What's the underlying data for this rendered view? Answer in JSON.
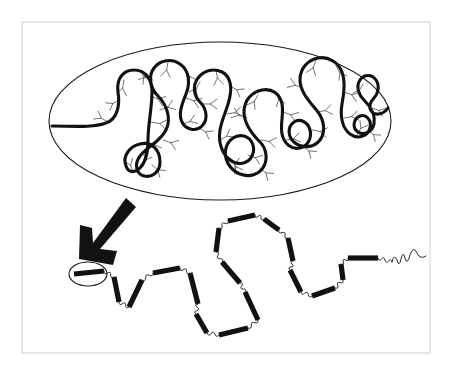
{
  "figure": {
    "title": "Condensed coiled biopolymer and its extended rod-and-coil conformation",
    "background_color": "#ffffff",
    "frame_color": "#d8d8d8",
    "ink_color": "#111111",
    "branch_color": "#5b5b5b"
  },
  "frame": {
    "name": "figure-border",
    "x": 22,
    "y": 22,
    "width": 408,
    "height": 331
  },
  "panels": [
    {
      "id": "condensed-panel",
      "label": "condensed coiled state inside oval compartment",
      "shape": "ellipse",
      "center_x": 220,
      "center_y": 121,
      "radius_x": 171,
      "radius_y": 79
    },
    {
      "id": "extended-panel",
      "label": "extended rod-and-coil chain",
      "shape": "open chain",
      "x": 60,
      "y": 205,
      "width": 350,
      "height": 145
    }
  ],
  "arrow": {
    "name": "transition-arrow",
    "label": "unfolding transition arrow",
    "direction": "down-left",
    "from_x": 124,
    "from_y": 200,
    "to_x": 88,
    "to_y": 258,
    "color": "#121212"
  },
  "highlight": {
    "name": "segment-highlight",
    "label": "circled single rigid rod segment",
    "center_x": 88,
    "center_y": 274,
    "radius_x": 19,
    "radius_y": 12
  },
  "condensed_backbone": {
    "name": "folded-backbone",
    "stroke_width": 3.1,
    "description": "thick serpentine backbone folded into four vertical loops spanning the oval",
    "path": "M 52 126 C 72 126 92 128 106 123 C 118 119 120 104 118 92 C 116 78 124 70 134 70 C 146 70 152 80 152 92 C 152 108 148 124 148 140 C 148 152 146 162 140 168 C 134 174 128 172 126 166 C 122 156 130 146 140 144 C 152 141 160 150 160 162 C 160 172 152 178 144 176 C 136 174 134 164 140 156 C 148 146 160 142 166 130 C 172 118 166 104 158 96 C 150 88 148 76 154 68 C 160 60 172 58 180 64 C 190 71 190 84 186 94 C 182 104 178 114 182 122 C 186 130 196 132 202 126 C 209 119 206 108 200 102 C 194 96 192 86 198 78 C 204 70 214 68 222 72 C 230 76 232 86 230 96 C 228 108 222 118 220 130 C 218 142 222 154 230 160 C 238 166 248 164 252 156 C 256 148 252 138 244 136 C 236 134 228 140 226 148 C 223 159 230 170 240 174 C 250 178 260 174 264 166 C 268 158 266 148 260 142 C 252 134 244 124 244 112 C 244 100 252 92 262 90 C 272 88 280 94 282 104 C 284 114 280 124 282 134 C 284 144 292 150 300 148 C 308 146 312 138 310 130 C 308 122 300 118 294 122 C 287 127 288 137 294 142 C 302 149 314 148 320 140 C 326 132 324 120 318 112 C 310 102 300 92 300 80 C 300 68 308 60 318 58 C 328 56 338 62 342 72 C 346 82 344 94 342 104 C 340 116 342 128 350 134 C 358 140 368 136 370 128 C 372 120 366 114 360 116 C 353 119 352 128 358 132 C 364 136 372 132 374 124 C 376 114 370 106 364 100 C 358 94 356 86 360 80 C 364 74 372 74 376 80 C 380 86 378 94 374 98 C 370 102 368 108 372 112 C 376 116 384 114 388 108"
  },
  "side_branches": {
    "name": "side-chain-branches",
    "count": 46,
    "style": "short thin Y-shaped tufts radiating from the backbone",
    "stroke_width": 0.85,
    "items": [
      {
        "x": 108,
        "y": 122,
        "angle": 210,
        "len": 14
      },
      {
        "x": 119,
        "y": 100,
        "angle": 150,
        "len": 13
      },
      {
        "x": 124,
        "y": 80,
        "angle": 100,
        "len": 15
      },
      {
        "x": 140,
        "y": 70,
        "angle": 60,
        "len": 14
      },
      {
        "x": 150,
        "y": 96,
        "angle": 20,
        "len": 15
      },
      {
        "x": 151,
        "y": 122,
        "angle": 10,
        "len": 16
      },
      {
        "x": 147,
        "y": 146,
        "angle": 350,
        "len": 14
      },
      {
        "x": 141,
        "y": 167,
        "angle": 300,
        "len": 14
      },
      {
        "x": 133,
        "y": 172,
        "angle": 250,
        "len": 13
      },
      {
        "x": 152,
        "y": 165,
        "angle": 40,
        "len": 14
      },
      {
        "x": 163,
        "y": 140,
        "angle": 20,
        "len": 15
      },
      {
        "x": 160,
        "y": 110,
        "angle": 340,
        "len": 15
      },
      {
        "x": 153,
        "y": 80,
        "angle": 200,
        "len": 14
      },
      {
        "x": 168,
        "y": 62,
        "angle": 100,
        "len": 15
      },
      {
        "x": 186,
        "y": 70,
        "angle": 60,
        "len": 14
      },
      {
        "x": 186,
        "y": 98,
        "angle": 20,
        "len": 15
      },
      {
        "x": 183,
        "y": 124,
        "angle": 340,
        "len": 14
      },
      {
        "x": 199,
        "y": 128,
        "angle": 30,
        "len": 14
      },
      {
        "x": 202,
        "y": 104,
        "angle": 0,
        "len": 15
      },
      {
        "x": 200,
        "y": 82,
        "angle": 120,
        "len": 14
      },
      {
        "x": 216,
        "y": 70,
        "angle": 80,
        "len": 15
      },
      {
        "x": 230,
        "y": 86,
        "angle": 30,
        "len": 14
      },
      {
        "x": 227,
        "y": 114,
        "angle": 350,
        "len": 15
      },
      {
        "x": 220,
        "y": 140,
        "angle": 330,
        "len": 14
      },
      {
        "x": 232,
        "y": 160,
        "angle": 60,
        "len": 14
      },
      {
        "x": 248,
        "y": 155,
        "angle": 20,
        "len": 14
      },
      {
        "x": 235,
        "y": 172,
        "angle": 270,
        "len": 14
      },
      {
        "x": 260,
        "y": 168,
        "angle": 40,
        "len": 14
      },
      {
        "x": 261,
        "y": 140,
        "angle": 10,
        "len": 15
      },
      {
        "x": 247,
        "y": 118,
        "angle": 200,
        "len": 15
      },
      {
        "x": 258,
        "y": 95,
        "angle": 120,
        "len": 14
      },
      {
        "x": 276,
        "y": 92,
        "angle": 70,
        "len": 14
      },
      {
        "x": 283,
        "y": 112,
        "angle": 20,
        "len": 15
      },
      {
        "x": 286,
        "y": 140,
        "angle": 350,
        "len": 14
      },
      {
        "x": 303,
        "y": 146,
        "angle": 40,
        "len": 14
      },
      {
        "x": 312,
        "y": 130,
        "angle": 10,
        "len": 15
      },
      {
        "x": 317,
        "y": 112,
        "angle": 350,
        "len": 15
      },
      {
        "x": 303,
        "y": 88,
        "angle": 200,
        "len": 15
      },
      {
        "x": 316,
        "y": 60,
        "angle": 110,
        "len": 15
      },
      {
        "x": 336,
        "y": 66,
        "angle": 60,
        "len": 14
      },
      {
        "x": 344,
        "y": 92,
        "angle": 20,
        "len": 15
      },
      {
        "x": 344,
        "y": 118,
        "angle": 350,
        "len": 14
      },
      {
        "x": 357,
        "y": 135,
        "angle": 300,
        "len": 14
      },
      {
        "x": 368,
        "y": 130,
        "angle": 40,
        "len": 13
      },
      {
        "x": 372,
        "y": 108,
        "angle": 20,
        "len": 13
      },
      {
        "x": 363,
        "y": 84,
        "angle": 120,
        "len": 13
      }
    ]
  },
  "extended_chain": {
    "name": "rod-and-coil-chain",
    "rod_count": 18,
    "rod_color": "#111111",
    "rod_thickness": 5.2,
    "coil_color": "#2a2a2a",
    "description": "alternating rigid rod segments and flexible coil linkers forming a zig-zag extended chain",
    "nodes": [
      {
        "x": 74,
        "y": 274
      },
      {
        "x": 104,
        "y": 271
      },
      {
        "x": 114,
        "y": 277
      },
      {
        "x": 119,
        "y": 302
      },
      {
        "x": 129,
        "y": 307
      },
      {
        "x": 142,
        "y": 280
      },
      {
        "x": 153,
        "y": 273
      },
      {
        "x": 180,
        "y": 268
      },
      {
        "x": 190,
        "y": 273
      },
      {
        "x": 198,
        "y": 304
      },
      {
        "x": 196,
        "y": 314
      },
      {
        "x": 207,
        "y": 333
      },
      {
        "x": 219,
        "y": 335
      },
      {
        "x": 248,
        "y": 328
      },
      {
        "x": 258,
        "y": 320
      },
      {
        "x": 245,
        "y": 292
      },
      {
        "x": 240,
        "y": 283
      },
      {
        "x": 222,
        "y": 262
      },
      {
        "x": 216,
        "y": 252
      },
      {
        "x": 219,
        "y": 228
      },
      {
        "x": 228,
        "y": 221
      },
      {
        "x": 255,
        "y": 215
      },
      {
        "x": 264,
        "y": 219
      },
      {
        "x": 279,
        "y": 230
      },
      {
        "x": 288,
        "y": 238
      },
      {
        "x": 293,
        "y": 261
      },
      {
        "x": 290,
        "y": 270
      },
      {
        "x": 301,
        "y": 292
      },
      {
        "x": 312,
        "y": 296
      },
      {
        "x": 335,
        "y": 288
      },
      {
        "x": 343,
        "y": 280
      },
      {
        "x": 341,
        "y": 264
      },
      {
        "x": 348,
        "y": 258
      },
      {
        "x": 378,
        "y": 258
      },
      {
        "x": 392,
        "y": 262
      }
    ],
    "free_end": {
      "name": "chain-free-end-squiggle",
      "x": 392,
      "y": 260,
      "description": "small open squiggle terminating the right end of the chain"
    }
  }
}
